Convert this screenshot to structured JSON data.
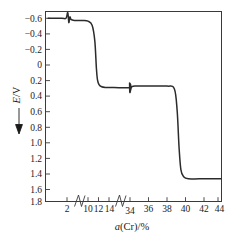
{
  "chart_data": {
    "type": "line",
    "title": "",
    "xlabel": "a(Cr)/%",
    "ylabel": "E/V",
    "ylabel_parts": {
      "symbol": "E",
      "separator": "/",
      "unit": "V"
    },
    "xlabel_parts": {
      "symbol": "a",
      "species": "(Cr)",
      "separator": "/",
      "unit": "%"
    },
    "y_axis_direction": "inverted",
    "y_axis_arrow": "down",
    "ylim": [
      -0.6,
      1.8
    ],
    "y_ticks": [
      -0.6,
      -0.4,
      -0.2,
      0,
      0.2,
      0.4,
      0.6,
      0.8,
      1.0,
      1.2,
      1.4,
      1.6,
      1.8
    ],
    "y_tick_labels": [
      "−0.6",
      "−0.4",
      "−0.2",
      "0",
      "0.2",
      "0.4",
      "0.6",
      "0.8",
      "1.0",
      "1.2",
      "1.4",
      "1.6",
      "1.8"
    ],
    "x_ticks": [
      2,
      10,
      12,
      14,
      34,
      36,
      38,
      40,
      42,
      44
    ],
    "x_tick_labels": [
      "2",
      "10",
      "12",
      "14",
      "34",
      "36",
      "38",
      "40",
      "42",
      "44"
    ],
    "x_axis_breaks": [
      {
        "between": [
          2,
          10
        ],
        "label": "axis-break-1"
      },
      {
        "between": [
          14,
          34
        ],
        "label": "axis-break-2"
      }
    ],
    "grid": false,
    "legend": false,
    "series": [
      {
        "name": "E vs a(Cr)",
        "points": [
          [
            0.2,
            -0.6
          ],
          [
            1.5,
            -0.6
          ],
          [
            1.9,
            -0.6
          ],
          [
            2.3,
            -0.68
          ],
          [
            2.7,
            -0.54
          ],
          [
            3.1,
            -0.62
          ],
          [
            3.6,
            -0.58
          ],
          [
            5.0,
            -0.57
          ],
          [
            8.0,
            -0.57
          ],
          [
            10.0,
            -0.56
          ],
          [
            10.8,
            -0.5
          ],
          [
            11.3,
            -0.28
          ],
          [
            11.6,
            0.1
          ],
          [
            11.8,
            0.26
          ],
          [
            12.1,
            0.33
          ],
          [
            12.6,
            0.36
          ],
          [
            13.4,
            0.37
          ],
          [
            14.0,
            0.37
          ],
          [
            33.2,
            0.37
          ],
          [
            33.6,
            0.31
          ],
          [
            33.9,
            0.44
          ],
          [
            34.2,
            0.36
          ],
          [
            34.8,
            0.35
          ],
          [
            36.0,
            0.35
          ],
          [
            38.0,
            0.35
          ],
          [
            38.8,
            0.39
          ],
          [
            39.1,
            0.7
          ],
          [
            39.3,
            1.2
          ],
          [
            39.5,
            1.52
          ],
          [
            39.8,
            1.62
          ],
          [
            40.3,
            1.65
          ],
          [
            41.5,
            1.65
          ],
          [
            44.0,
            1.65
          ],
          [
            45.2,
            1.65
          ]
        ],
        "plateaus": [
          {
            "value": -0.58,
            "range": [
              0.2,
              10.5
            ],
            "note": "first plateau"
          },
          {
            "value": 0.36,
            "range": [
              12.5,
              38.5
            ],
            "note": "second plateau"
          },
          {
            "value": 1.65,
            "range": [
              40.3,
              45.2
            ],
            "note": "third plateau"
          }
        ],
        "transitions": [
          {
            "at": 11.5,
            "from": -0.56,
            "to": 0.35,
            "note": "first potential step"
          },
          {
            "at": 39.2,
            "from": 0.36,
            "to": 1.65,
            "note": "second potential step"
          }
        ],
        "spikes": [
          {
            "at": 2.5,
            "note": "small oscillation near 2%"
          },
          {
            "at": 33.8,
            "note": "small oscillation near 34%"
          }
        ]
      }
    ]
  }
}
